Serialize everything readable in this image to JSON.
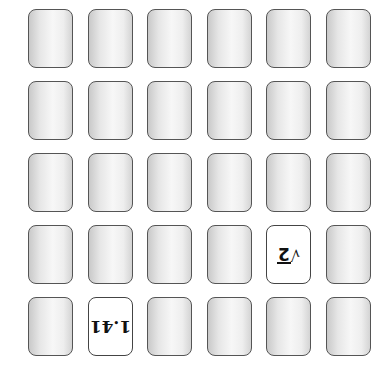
{
  "board": {
    "rows": 5,
    "cols": 6,
    "grid_left": 28,
    "grid_top": 9,
    "col_step": 59.6,
    "row_step": 72,
    "card_color_back": "#e6e6e6",
    "card_color_face": "#ffffff",
    "border_color": "#555555"
  },
  "cards": [
    {
      "row": 0,
      "col": 0,
      "face_up": false,
      "label": ""
    },
    {
      "row": 0,
      "col": 1,
      "face_up": false,
      "label": ""
    },
    {
      "row": 0,
      "col": 2,
      "face_up": false,
      "label": ""
    },
    {
      "row": 0,
      "col": 3,
      "face_up": false,
      "label": ""
    },
    {
      "row": 0,
      "col": 4,
      "face_up": false,
      "label": ""
    },
    {
      "row": 0,
      "col": 5,
      "face_up": false,
      "label": ""
    },
    {
      "row": 1,
      "col": 0,
      "face_up": false,
      "label": ""
    },
    {
      "row": 1,
      "col": 1,
      "face_up": false,
      "label": ""
    },
    {
      "row": 1,
      "col": 2,
      "face_up": false,
      "label": ""
    },
    {
      "row": 1,
      "col": 3,
      "face_up": false,
      "label": ""
    },
    {
      "row": 1,
      "col": 4,
      "face_up": false,
      "label": ""
    },
    {
      "row": 1,
      "col": 5,
      "face_up": false,
      "label": ""
    },
    {
      "row": 2,
      "col": 0,
      "face_up": false,
      "label": ""
    },
    {
      "row": 2,
      "col": 1,
      "face_up": false,
      "label": ""
    },
    {
      "row": 2,
      "col": 2,
      "face_up": false,
      "label": ""
    },
    {
      "row": 2,
      "col": 3,
      "face_up": false,
      "label": ""
    },
    {
      "row": 2,
      "col": 4,
      "face_up": false,
      "label": ""
    },
    {
      "row": 2,
      "col": 5,
      "face_up": false,
      "label": ""
    },
    {
      "row": 3,
      "col": 0,
      "face_up": false,
      "label": ""
    },
    {
      "row": 3,
      "col": 1,
      "face_up": false,
      "label": ""
    },
    {
      "row": 3,
      "col": 2,
      "face_up": false,
      "label": ""
    },
    {
      "row": 3,
      "col": 3,
      "face_up": false,
      "label": ""
    },
    {
      "row": 3,
      "col": 4,
      "face_up": true,
      "label": "√2",
      "sqrt_sign": "√",
      "radicand": "2"
    },
    {
      "row": 3,
      "col": 5,
      "face_up": false,
      "label": ""
    },
    {
      "row": 4,
      "col": 0,
      "face_up": false,
      "label": ""
    },
    {
      "row": 4,
      "col": 1,
      "face_up": true,
      "label": "1.41"
    },
    {
      "row": 4,
      "col": 2,
      "face_up": false,
      "label": ""
    },
    {
      "row": 4,
      "col": 3,
      "face_up": false,
      "label": ""
    },
    {
      "row": 4,
      "col": 4,
      "face_up": false,
      "label": ""
    },
    {
      "row": 4,
      "col": 5,
      "face_up": false,
      "label": ""
    }
  ]
}
